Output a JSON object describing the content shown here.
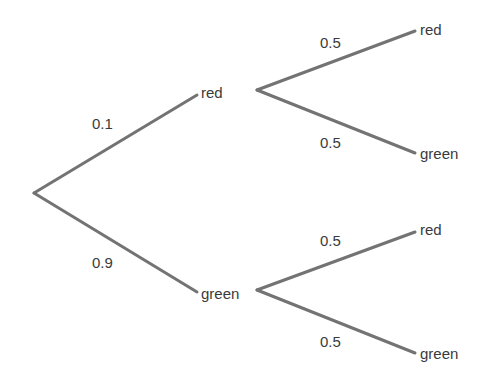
{
  "diagram": {
    "type": "probability-tree",
    "root": {
      "x": 34,
      "y": 193
    },
    "level1": [
      {
        "outcome": "red",
        "probability": "0.1",
        "node": {
          "x": 197,
          "y": 95
        },
        "label_pos": {
          "x": 201,
          "y": 98
        },
        "prob_pos": {
          "x": 92,
          "y": 129
        }
      },
      {
        "outcome": "green",
        "probability": "0.9",
        "node": {
          "x": 197,
          "y": 292
        },
        "label_pos": {
          "x": 201,
          "y": 299
        },
        "prob_pos": {
          "x": 92,
          "y": 268
        }
      }
    ],
    "level2": [
      {
        "parent": "red",
        "fork": {
          "x": 257,
          "y": 90
        },
        "branches": [
          {
            "outcome": "red",
            "probability": "0.5",
            "end": {
              "x": 415,
              "y": 31
            },
            "label_pos": {
              "x": 420,
              "y": 35
            },
            "prob_pos": {
              "x": 320,
              "y": 48
            }
          },
          {
            "outcome": "green",
            "probability": "0.5",
            "end": {
              "x": 415,
              "y": 153
            },
            "label_pos": {
              "x": 420,
              "y": 159
            },
            "prob_pos": {
              "x": 320,
              "y": 148
            }
          }
        ]
      },
      {
        "parent": "green",
        "fork": {
          "x": 257,
          "y": 290
        },
        "branches": [
          {
            "outcome": "red",
            "probability": "0.5",
            "end": {
              "x": 415,
              "y": 232
            },
            "label_pos": {
              "x": 420,
              "y": 235
            },
            "prob_pos": {
              "x": 320,
              "y": 246
            }
          },
          {
            "outcome": "green",
            "probability": "0.5",
            "end": {
              "x": 415,
              "y": 353
            },
            "label_pos": {
              "x": 420,
              "y": 359
            },
            "prob_pos": {
              "x": 320,
              "y": 347
            }
          }
        ]
      }
    ],
    "colors": {
      "edge": "#737373",
      "text": "#3a3a3a",
      "background": "#ffffff"
    }
  }
}
